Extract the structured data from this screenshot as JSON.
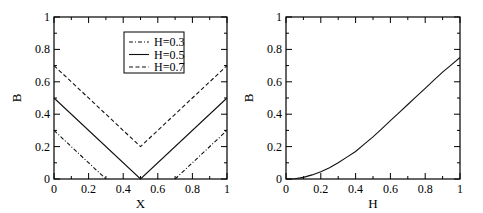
{
  "chart_data": [
    {
      "type": "line",
      "title": "",
      "xlabel": "X",
      "ylabel": "B",
      "xlim": [
        0,
        1
      ],
      "ylim": [
        0,
        1
      ],
      "xticks": [
        "0",
        "0.2",
        "0.4",
        "0.6",
        "0.8",
        "1"
      ],
      "yticks": [
        "0",
        "0.2",
        "0.4",
        "0.6",
        "0.8",
        "1"
      ],
      "grid": false,
      "legend_position": "upper-center-right",
      "series": [
        {
          "name": "H=0.3",
          "style": "dash-dot",
          "x": [
            0,
            0.3,
            0.7,
            1
          ],
          "y": [
            0.3,
            0,
            0,
            0.3
          ],
          "segments": [
            [
              [
                0,
                0.3
              ],
              [
                0.3,
                0
              ]
            ],
            [
              [
                0.7,
                0
              ],
              [
                1,
                0.3
              ]
            ]
          ]
        },
        {
          "name": "H=0.5",
          "style": "solid",
          "x": [
            0,
            0.5,
            1
          ],
          "y": [
            0.5,
            0,
            0.5
          ]
        },
        {
          "name": "H=0.7",
          "style": "dashed",
          "x": [
            0,
            0.5,
            1
          ],
          "y": [
            0.7,
            0.2,
            0.7
          ]
        }
      ]
    },
    {
      "type": "line",
      "title": "",
      "xlabel": "H",
      "ylabel": "B",
      "xlim": [
        0,
        1
      ],
      "ylim": [
        0,
        1
      ],
      "xticks": [
        "0",
        "0.2",
        "0.4",
        "0.6",
        "0.8",
        "1"
      ],
      "yticks": [
        "0",
        "0.2",
        "0.4",
        "0.6",
        "0.8",
        "1"
      ],
      "grid": false,
      "series": [
        {
          "name": "B(H)",
          "style": "solid",
          "x": [
            0,
            0.05,
            0.1,
            0.15,
            0.2,
            0.25,
            0.3,
            0.35,
            0.4,
            0.45,
            0.5,
            0.55,
            0.6,
            0.65,
            0.7,
            0.75,
            0.8,
            0.85,
            0.9,
            0.95,
            1.0
          ],
          "y": [
            0,
            0.002,
            0.01,
            0.025,
            0.045,
            0.07,
            0.1,
            0.135,
            0.17,
            0.215,
            0.26,
            0.31,
            0.36,
            0.41,
            0.46,
            0.51,
            0.56,
            0.61,
            0.66,
            0.705,
            0.75
          ]
        }
      ]
    }
  ],
  "plots": {
    "left": {
      "xlabel": "X",
      "ylabel": "B",
      "legend": [
        "H=0.3",
        "H=0.5",
        "H=0.7"
      ]
    },
    "right": {
      "xlabel": "H",
      "ylabel": "B"
    }
  }
}
